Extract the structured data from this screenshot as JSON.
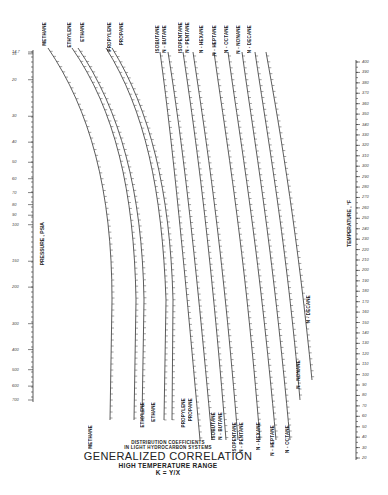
{
  "chart_data": {
    "type": "nomograph",
    "title": "GENERALIZED CORRELATION",
    "subtitle": "HIGH TEMPERATURE RANGE",
    "caption_top": "DISTRIBUTION COEFFICIENTS IN LIGHT HYDROCARBON SYSTEMS",
    "formula": "K = Y/X",
    "pressure_axis": {
      "label": "PRESSURE , PSIA",
      "ticks": [
        "14.7",
        "15",
        "20",
        "30",
        "40",
        "50",
        "60",
        "70",
        "80",
        "90",
        "100",
        "150",
        "200",
        "300",
        "400",
        "500",
        "600",
        "700"
      ]
    },
    "temperature_axis": {
      "label": "TEMPERATURE , °F",
      "ticks": [
        "400",
        "390",
        "380",
        "370",
        "360",
        "350",
        "340",
        "330",
        "320",
        "310",
        "300",
        "290",
        "280",
        "270",
        "260",
        "250",
        "240",
        "230",
        "220",
        "210",
        "200",
        "190",
        "180",
        "170",
        "160",
        "150",
        "140",
        "130",
        "120",
        "110",
        "100",
        "90",
        "80",
        "70",
        "60",
        "50",
        "40",
        "30",
        "20"
      ]
    },
    "k_scales_top": [
      "METHANE",
      "ETHYLENE",
      "ETHANE",
      "PROPYLENE",
      "PROPANE",
      "ISOBUTANE",
      "N - BUTANE",
      "ISOPENTANE",
      "N - PENTANE",
      "N - HEXANE",
      "N - HEPTANE",
      "N - OCTANE",
      "N - NONANE",
      "N - DECANE"
    ],
    "k_scales_bottom": [
      "METHANE",
      "ETHYLENE",
      "ETHANE",
      "PROPYLENE",
      "PROPANE",
      "ISOBUTANE",
      "N - BUTANE",
      "ISOPENTANE",
      "N - PENTANE",
      "N - HEXANE",
      "N - HEPTANE",
      "N - OCTANE",
      "N - NONANE",
      "N - DECANE"
    ],
    "methane_ticks": [
      "200",
      "150",
      "100",
      "80",
      "70",
      "60",
      "50",
      "40",
      "30",
      "20",
      "15",
      "10",
      "9",
      "8",
      "7",
      "6",
      "5",
      "4",
      "3"
    ],
    "grid": false,
    "legend": "none"
  },
  "labels": {
    "caption_line1": "DISTRIBUTION COEFFICIENTS",
    "caption_line2": "IN LIGHT HYDROCARBON  SYSTEMS",
    "title": "GENERALIZED CORRELATION",
    "subtitle": "HIGH TEMPERATURE RANGE",
    "formula": "K = Y/X",
    "pressure_title": "PRESSURE , PSIA",
    "temperature_title": "TEMPERATURE , °F"
  }
}
